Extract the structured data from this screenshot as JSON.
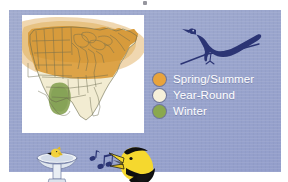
{
  "figure": {
    "kind": "bird-range-map-infographic",
    "panel_background_color": "#9aa5cf",
    "map_background_color": "#ffffff"
  },
  "map": {
    "name": "united-states-range-map",
    "region": "Continental United States",
    "state_outline_color": "#6b6b4e",
    "regions": [
      {
        "season": "Spring/Summer",
        "color": "#e2a33f",
        "area": "Northern and Midwestern United States"
      },
      {
        "season": "Year-Round",
        "color": "#f2ecd2",
        "area": "Southern and Southeastern United States"
      },
      {
        "season": "Winter",
        "color": "#89a35a",
        "area": "Eastern Texas and Louisiana"
      }
    ]
  },
  "legend": {
    "title": "",
    "items": [
      {
        "label": "Spring/Summer",
        "color": "#e8a33c"
      },
      {
        "label": "Year-Round",
        "color": "#f6f0da"
      },
      {
        "label": "Winter",
        "color": "#8aa84f"
      }
    ],
    "text_color": "#ffffff"
  },
  "illustrations": {
    "perched_bird": {
      "name": "perched-blackbird-silhouette",
      "color": "#2b3474",
      "description": "Dark navy silhouette of a long-tailed blackbird perched on a thin branch"
    },
    "birdbath": {
      "name": "birdbath-with-bird",
      "basin_color": "#e8eef2",
      "bird_color": "#f2d13c",
      "description": "Pedestal birdbath with a small yellow bird perched on the rim"
    },
    "music_notes": {
      "name": "music-notes",
      "color": "#2b3474",
      "description": "Two eighth notes indicating birdsong"
    },
    "singing_bird": {
      "name": "singing-yellow-bird-head",
      "body_color": "#f5d82e",
      "accent_color": "#0f0f0f",
      "description": "Yellow bird head with open beak, singing"
    }
  }
}
